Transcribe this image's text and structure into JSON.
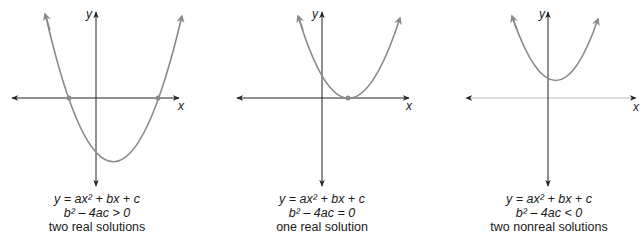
{
  "panels": [
    {
      "id": "positive-discriminant",
      "equation": "y = ax² + bx + c",
      "discriminant": "b² – 4ac > 0",
      "description": "two real solutions",
      "x_label": "x",
      "y_label": "y"
    },
    {
      "id": "zero-discriminant",
      "equation": "y = ax² + bx + c",
      "discriminant": "b² – 4ac = 0",
      "description": "one real solution",
      "x_label": "x",
      "y_label": "y"
    },
    {
      "id": "negative-discriminant",
      "equation": "y = ax² + bx + c",
      "discriminant": "b² – 4ac < 0",
      "description": "two nonreal solutions",
      "x_label": "x",
      "y_label": "y"
    }
  ],
  "colors": {
    "curve": "#8a8a8a",
    "axis": "#222222",
    "text": "#1a1a1a"
  }
}
